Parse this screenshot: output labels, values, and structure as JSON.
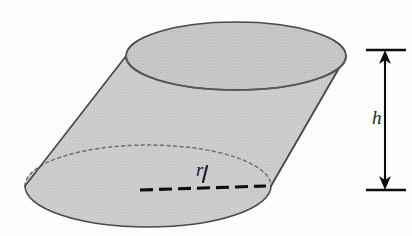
{
  "figure": {
    "shape": "oblique-cylinder",
    "background_color": "#fdfdfd",
    "fill_color": "#c9c9c9",
    "fill_color_top": "#c3c3c3",
    "outline_color": "#4a4a4a",
    "hidden_edge_color": "#6e6e6e",
    "dimension_color": "#1d1d1d",
    "labels": {
      "radius": "r",
      "height": "h"
    },
    "annotations": {
      "radius_line_style": "dashed",
      "height_line_style": "double-arrow",
      "hidden_ellipse_style": "dotted"
    },
    "geometry": {
      "top_ellipse": {
        "cx": 236,
        "cy": 56,
        "rx": 110,
        "ry": 34
      },
      "bottom_ellipse": {
        "cx": 148,
        "cy": 186,
        "rx": 123,
        "ry": 41
      },
      "radius_line": {
        "x1": 140,
        "y1": 190,
        "x2": 266,
        "y2": 186
      },
      "height_dimension": {
        "x": 385,
        "y_top": 50,
        "y_bottom": 190
      }
    }
  }
}
